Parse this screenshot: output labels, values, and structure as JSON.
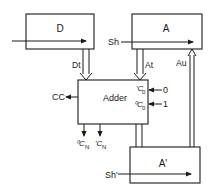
{
  "diagram": {
    "blocks": {
      "d": {
        "label": "D"
      },
      "a": {
        "label": "A"
      },
      "adder": {
        "label": "Adder"
      },
      "a_prime": {
        "label": "A'"
      }
    },
    "signals": {
      "d_transfer": "Dt",
      "a_transfer": "At",
      "a_update": "Au",
      "shift_a": "Sh",
      "shift_a_prime": "Sh'",
      "carry_out": "CC",
      "carry_in_1_label": "'C",
      "carry_in_1_sub": "0",
      "carry_in_1_value": "0",
      "carry_in_0_label": "⁰C",
      "carry_in_0_sub": "0",
      "carry_in_0_value": "1",
      "carry_n_0_label": "⁰C",
      "carry_n_0_sub": "N",
      "carry_n_1_label": "'C",
      "carry_n_1_sub": "N"
    },
    "colors": {
      "ink": "#1a1a1a",
      "background": "#ffffff"
    }
  }
}
